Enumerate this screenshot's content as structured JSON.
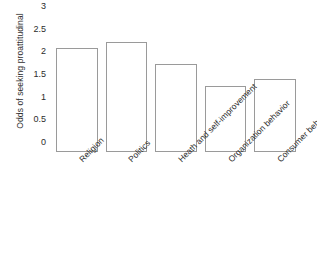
{
  "chart_data": {
    "type": "bar",
    "title": "",
    "subtitle": "",
    "xlabel": "",
    "ylabel": "Odds of seeking proattitudinal",
    "categories": [
      "Religion",
      "Politics",
      "Heath and self-improvement",
      "Organization behavior",
      "Consumer behavior"
    ],
    "values": [
      2.3,
      2.42,
      1.95,
      1.45,
      1.62
    ],
    "ylim": [
      0,
      3
    ],
    "yticks": [
      "0",
      "0.5",
      "1",
      "1.5",
      "2",
      "2.5",
      "3"
    ],
    "ytick_values": [
      0,
      0.5,
      1,
      1.5,
      2,
      2.5,
      3
    ],
    "grid": false,
    "legend": "none",
    "bar_fill": "#ffffff",
    "bar_edge": "#9a9a9a"
  }
}
